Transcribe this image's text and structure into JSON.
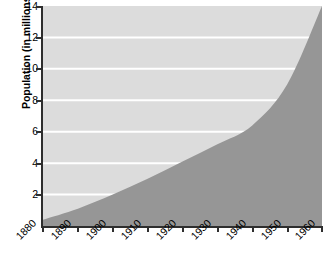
{
  "chart_data": {
    "type": "area",
    "title": "",
    "xlabel": "",
    "ylabel": "Population (in millions)",
    "xlim": [
      1880,
      1960
    ],
    "ylim": [
      0,
      14
    ],
    "grid": true,
    "legend": "none",
    "x_tick_labels": [
      "1880",
      "1890",
      "1900",
      "1910",
      "1920",
      "1930",
      "1940",
      "1950",
      "1960"
    ],
    "y_tick_labels": [
      "2",
      "4",
      "6",
      "8",
      "10",
      "12",
      "14"
    ],
    "x": [
      1880,
      1890,
      1900,
      1910,
      1920,
      1930,
      1940,
      1950,
      1960
    ],
    "values": [
      0.4,
      1.1,
      2.0,
      3.0,
      4.1,
      5.2,
      6.4,
      9.0,
      14.0
    ],
    "series": [
      {
        "name": "Population",
        "values": [
          0.4,
          1.1,
          2.0,
          3.0,
          4.1,
          5.2,
          6.4,
          9.0,
          14.0
        ]
      }
    ],
    "colors": {
      "plot_background": "#dcdcdc",
      "area_fill": "#969696",
      "gridline": "#ffffff",
      "axis": "#2e2e2e",
      "text": "#000000"
    }
  }
}
